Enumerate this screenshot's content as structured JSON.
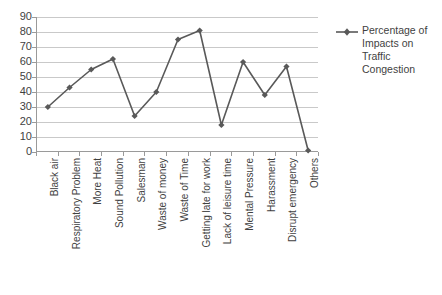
{
  "chart_data": {
    "type": "line",
    "title": "",
    "xlabel": "",
    "ylabel": "",
    "ylim": [
      0,
      90
    ],
    "ytick_step": 10,
    "yticks": [
      0,
      10,
      20,
      30,
      40,
      50,
      60,
      70,
      80,
      90
    ],
    "grid": true,
    "legend_position": "right",
    "categories": [
      "Black air",
      "Respiratory Problem",
      "More Heat",
      "Sound Pollution",
      "Salesman",
      "Waste of money",
      "Waste of Time",
      "Getting late for work",
      "Lack of leisure time",
      "Mental Pressure",
      "Harassment",
      "Disrupt emergency",
      "Others"
    ],
    "series": [
      {
        "name": "Percentage of Impacts on Traffic Congestion",
        "values": [
          30,
          43,
          55,
          62,
          24,
          40,
          75,
          81,
          18,
          60,
          38,
          57,
          1
        ],
        "color": "#595959",
        "marker": "diamond"
      }
    ]
  },
  "legend": {
    "entries": [
      {
        "label": "Percentage of Impacts on Traffic Congestion",
        "marker_name": "legend-line-diamond-marker"
      }
    ]
  },
  "colors": {
    "series": "#595959",
    "gridline": "#c9c9c9",
    "axis": "#9a9a9a",
    "text": "#3f3f3f",
    "background": "#ffffff"
  }
}
